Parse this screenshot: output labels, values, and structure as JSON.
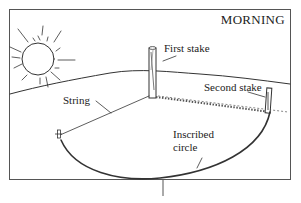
{
  "diagram": {
    "title": "MORNING",
    "labels": {
      "first_stake": "First stake",
      "second_stake": "Second stake",
      "string": "String",
      "inscribed_circle": [
        "Inscribed",
        "circle"
      ]
    },
    "icons": {
      "sun": "sun-icon"
    },
    "colors": {
      "ink": "#333333",
      "background": "#ffffff",
      "frame": "#555555"
    }
  }
}
